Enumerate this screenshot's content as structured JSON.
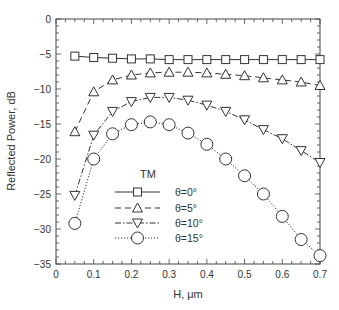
{
  "chart_data": {
    "type": "line",
    "title": "",
    "annotation": "TM",
    "xlabel": "H, μm",
    "ylabel": "Reflected Power, dB",
    "xlim": [
      0,
      0.7
    ],
    "ylim": [
      -35,
      0
    ],
    "x_ticks": [
      "0",
      "0.1",
      "0.2",
      "0.3",
      "0.4",
      "0.5",
      "0.6",
      "0.7"
    ],
    "y_ticks": [
      "0",
      "-5",
      "-10",
      "-15",
      "-20",
      "-25",
      "-30",
      "-35"
    ],
    "grid": false,
    "legend_position": "lower-center-left inside plot",
    "x": [
      0.05,
      0.1,
      0.15,
      0.2,
      0.25,
      0.3,
      0.35,
      0.4,
      0.45,
      0.5,
      0.55,
      0.6,
      0.65,
      0.7
    ],
    "series": [
      {
        "name": "θ=0°",
        "marker": "square",
        "line": "solid",
        "values": [
          -5.3,
          -5.5,
          -5.6,
          -5.7,
          -5.7,
          -5.8,
          -5.8,
          -5.8,
          -5.8,
          -5.8,
          -5.8,
          -5.8,
          -5.8,
          -5.8
        ]
      },
      {
        "name": "θ=5°",
        "marker": "triangle-up",
        "line": "dashed",
        "values": [
          -16.1,
          -10.4,
          -8.7,
          -8.0,
          -7.7,
          -7.6,
          -7.6,
          -7.7,
          -7.9,
          -8.1,
          -8.4,
          -8.7,
          -9.0,
          -9.5
        ]
      },
      {
        "name": "θ=10°",
        "marker": "triangle-down",
        "line": "dash-dot",
        "values": [
          -25.2,
          -16.6,
          -13.2,
          -11.8,
          -11.2,
          -11.2,
          -11.6,
          -12.3,
          -13.2,
          -14.4,
          -15.8,
          -17.1,
          -18.8,
          -20.5
        ]
      },
      {
        "name": "θ=15°",
        "marker": "circle",
        "line": "dotted",
        "values": [
          -29.2,
          -20.0,
          -16.4,
          -15.1,
          -14.7,
          -15.1,
          -16.3,
          -17.9,
          -20.0,
          -22.4,
          -25.0,
          -28.2,
          -31.5,
          -33.8
        ]
      }
    ]
  },
  "colors": {
    "line": "#333333",
    "axis": "#444444",
    "background": "#ffffff"
  }
}
